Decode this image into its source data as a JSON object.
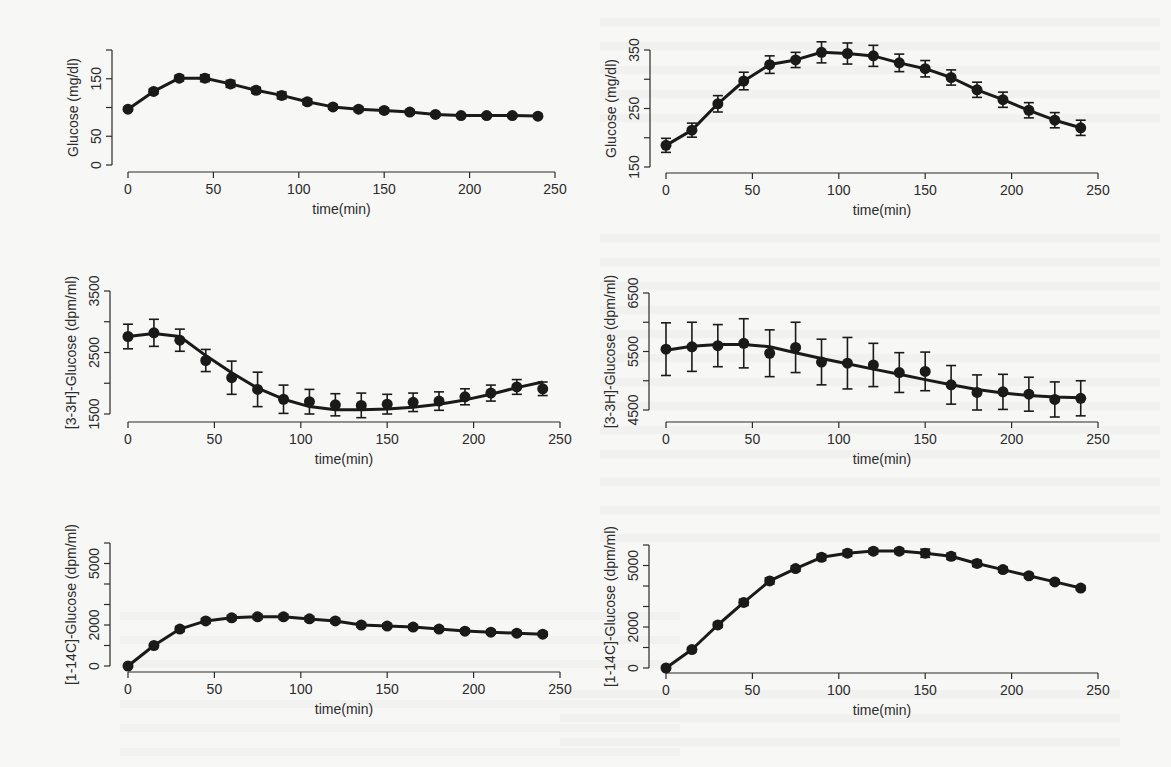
{
  "figure": {
    "panel_count": 6,
    "layout": "3 rows x 2 columns",
    "x_axis_label": "time(min)"
  },
  "chart_data": [
    {
      "id": "glucose-left",
      "type": "line",
      "title": "",
      "xlabel": "time(min)",
      "ylabel": "Glucose (mg/dl)",
      "x": [
        0,
        15,
        30,
        45,
        60,
        75,
        90,
        105,
        120,
        135,
        150,
        165,
        180,
        195,
        210,
        225,
        240
      ],
      "values": [
        97,
        128,
        151,
        151,
        141,
        130,
        121,
        110,
        101,
        97,
        95,
        92,
        88,
        86,
        86,
        86,
        85
      ],
      "errors": [
        3,
        4,
        5,
        6,
        6,
        5,
        6,
        5,
        4,
        4,
        4,
        4,
        3,
        3,
        3,
        3,
        3
      ],
      "xlim": [
        0,
        250
      ],
      "ylim": [
        0,
        200
      ],
      "xticks": [
        "0",
        "50",
        "100",
        "150",
        "200",
        "250"
      ],
      "yticks": [
        0,
        50,
        100,
        150,
        200
      ],
      "ytick_labels": [
        "0",
        "50",
        "",
        "150",
        ""
      ],
      "grid": false,
      "legend": null
    },
    {
      "id": "glucose-right",
      "type": "line",
      "title": "",
      "xlabel": "time(min)",
      "ylabel": "Glucose (mg/dl)",
      "x": [
        0,
        15,
        30,
        45,
        60,
        75,
        90,
        105,
        120,
        135,
        150,
        165,
        180,
        195,
        210,
        225,
        240
      ],
      "values": [
        187,
        213,
        258,
        297,
        325,
        333,
        346,
        344,
        340,
        328,
        318,
        303,
        282,
        265,
        247,
        230,
        217
      ],
      "errors": [
        12,
        12,
        14,
        15,
        15,
        13,
        18,
        18,
        18,
        15,
        14,
        13,
        13,
        13,
        13,
        13,
        13
      ],
      "xlim": [
        0,
        250
      ],
      "ylim": [
        150,
        350
      ],
      "xticks": [
        "0",
        "50",
        "100",
        "150",
        "200",
        "250"
      ],
      "yticks": [
        150,
        200,
        250,
        300,
        350
      ],
      "ytick_labels": [
        "150",
        "",
        "250",
        "",
        "350"
      ],
      "grid": false,
      "legend": null
    },
    {
      "id": "3h-glucose-left",
      "type": "line",
      "title": "",
      "xlabel": "time(min)",
      "ylabel": "[3-3H]-Glucose (dpm/ml)",
      "x": [
        0,
        15,
        30,
        45,
        60,
        75,
        90,
        105,
        120,
        135,
        150,
        165,
        180,
        195,
        210,
        225,
        240
      ],
      "values": [
        2760,
        2820,
        2700,
        2370,
        2090,
        1900,
        1740,
        1700,
        1650,
        1640,
        1660,
        1690,
        1710,
        1780,
        1840,
        1940,
        1910
      ],
      "errors": [
        200,
        220,
        180,
        180,
        270,
        280,
        230,
        200,
        180,
        200,
        160,
        150,
        150,
        130,
        130,
        120,
        110
      ],
      "fit": [
        2760,
        2810,
        2760,
        2450,
        2170,
        1920,
        1740,
        1620,
        1570,
        1570,
        1580,
        1610,
        1660,
        1730,
        1820,
        1930,
        2020
      ],
      "xlim": [
        0,
        250
      ],
      "ylim": [
        1500,
        3500
      ],
      "xticks": [
        "0",
        "50",
        "100",
        "150",
        "200",
        "250"
      ],
      "yticks": [
        1500,
        2000,
        2500,
        3000,
        3500
      ],
      "ytick_labels": [
        "1500",
        "",
        "2500",
        "",
        "3500"
      ],
      "grid": false,
      "legend": null
    },
    {
      "id": "3h-glucose-right",
      "type": "line",
      "title": "",
      "xlabel": "time(min)",
      "ylabel": "[3-3H]-Glucose (dpm/ml)",
      "x": [
        0,
        15,
        30,
        45,
        60,
        75,
        90,
        105,
        120,
        135,
        150,
        165,
        180,
        195,
        210,
        225,
        240
      ],
      "values": [
        5540,
        5580,
        5600,
        5640,
        5470,
        5570,
        5320,
        5300,
        5270,
        5140,
        5160,
        4930,
        4800,
        4810,
        4770,
        4680,
        4700
      ],
      "errors": [
        450,
        420,
        360,
        420,
        400,
        430,
        390,
        440,
        370,
        340,
        330,
        330,
        300,
        300,
        290,
        300,
        300
      ],
      "fit": [
        5520,
        5590,
        5620,
        5620,
        5580,
        5480,
        5380,
        5290,
        5200,
        5110,
        5020,
        4930,
        4850,
        4790,
        4750,
        4720,
        4710
      ],
      "xlim": [
        0,
        250
      ],
      "ylim": [
        4500,
        6500
      ],
      "xticks": [
        "0",
        "50",
        "100",
        "150",
        "200",
        "250"
      ],
      "yticks": [
        4500,
        5000,
        5500,
        6000,
        6500
      ],
      "ytick_labels": [
        "4500",
        "",
        "5500",
        "",
        "6500"
      ],
      "grid": false,
      "legend": null
    },
    {
      "id": "14c-glucose-left",
      "type": "line",
      "title": "",
      "xlabel": "time(min)",
      "ylabel": "[1-14C]-Glucose (dpm/ml)",
      "x": [
        0,
        15,
        30,
        45,
        60,
        75,
        90,
        105,
        120,
        135,
        150,
        165,
        180,
        195,
        210,
        225,
        240
      ],
      "values": [
        0,
        1000,
        1800,
        2200,
        2350,
        2400,
        2400,
        2300,
        2200,
        2000,
        1950,
        1900,
        1800,
        1700,
        1650,
        1600,
        1550
      ],
      "errors": [
        60,
        80,
        120,
        120,
        120,
        120,
        120,
        120,
        110,
        110,
        110,
        110,
        100,
        100,
        100,
        100,
        100
      ],
      "xlim": [
        0,
        250
      ],
      "ylim": [
        0,
        6000
      ],
      "xticks": [
        "0",
        "50",
        "100",
        "150",
        "200",
        "250"
      ],
      "yticks": [
        0,
        1000,
        2000,
        3000,
        4000,
        5000,
        6000
      ],
      "ytick_labels": [
        "0",
        "",
        "2000",
        "",
        "",
        "5000",
        ""
      ],
      "grid": false,
      "legend": null
    },
    {
      "id": "14c-glucose-right",
      "type": "line",
      "title": "",
      "xlabel": "time(min)",
      "ylabel": "[1-14C]-Glucose (dpm/ml)",
      "x": [
        0,
        15,
        30,
        45,
        60,
        75,
        90,
        105,
        120,
        135,
        150,
        165,
        180,
        195,
        210,
        225,
        240
      ],
      "values": [
        0,
        900,
        2100,
        3200,
        4250,
        4850,
        5400,
        5600,
        5700,
        5700,
        5600,
        5450,
        5100,
        4800,
        4500,
        4200,
        3900
      ],
      "errors": [
        60,
        100,
        120,
        150,
        150,
        130,
        150,
        150,
        130,
        130,
        200,
        150,
        150,
        130,
        120,
        100,
        100
      ],
      "xlim": [
        0,
        250
      ],
      "ylim": [
        0,
        6000
      ],
      "xticks": [
        "0",
        "50",
        "100",
        "150",
        "200",
        "250"
      ],
      "yticks": [
        0,
        1000,
        2000,
        3000,
        4000,
        5000,
        6000
      ],
      "ytick_labels": [
        "0",
        "",
        "2000",
        "",
        "",
        "5000",
        ""
      ],
      "grid": false,
      "legend": null
    }
  ],
  "layout_px": {
    "panels": [
      {
        "yaxis_x": 112,
        "x0": 128,
        "x250": 555,
        "ytop": 50,
        "ybot": 165,
        "xaxis_y": 172,
        "ticklabel_y": 182,
        "title_y": 192
      },
      {
        "yaxis_x": 650,
        "x0": 666,
        "x250": 1098,
        "ytop": 50,
        "ybot": 167,
        "xaxis_y": 173,
        "ticklabel_y": 183,
        "title_y": 193
      },
      {
        "yaxis_x": 110,
        "x0": 128,
        "x250": 560,
        "ytop": 291,
        "ybot": 414,
        "xaxis_y": 422,
        "ticklabel_y": 437,
        "title_y": 467
      },
      {
        "yaxis_x": 649,
        "x0": 666,
        "x250": 1098,
        "ytop": 293,
        "ybot": 410,
        "xaxis_y": 422,
        "ticklabel_y": 437,
        "title_y": 467
      },
      {
        "yaxis_x": 110,
        "x0": 128,
        "x250": 560,
        "ytop": 543,
        "ybot": 666,
        "xaxis_y": 672,
        "ticklabel_y": 691,
        "title_y": 716
      },
      {
        "yaxis_x": 649,
        "x0": 666,
        "x250": 1098,
        "ytop": 545,
        "ybot": 668,
        "xaxis_y": 673,
        "ticklabel_y": 691,
        "title_y": 716
      }
    ]
  }
}
